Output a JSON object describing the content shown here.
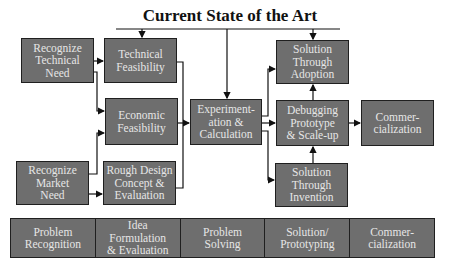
{
  "title": "Current State of the Art",
  "boxes": {
    "recognize_technical_need": "Recognize\nTechnical\nNeed",
    "technical_feasibility": "Technical\nFeasibility",
    "economic_feasibility": "Economic\nFeasibility",
    "recognize_market_need": "Recognize\nMarket\nNeed",
    "rough_design": "Rough Design\nConcept &\nEvaluation",
    "experimentation": "Experiment-\nation &\nCalculation",
    "solution_adoption": "Solution\nThrough\nAdoption",
    "debugging": "Debugging\nPrototype\n& Scale-up",
    "commercialization": "Commer-\ncialization",
    "solution_invention": "Solution\nThrough\nInvention"
  },
  "phases": [
    "Problem\nRecognition",
    "Idea\nFormulation\n& Evaluation",
    "Problem\nSolving",
    "Solution/\nPrototyping",
    "Commer-\ncialization"
  ],
  "colors": {
    "box_fill": "#6e6e6e",
    "box_border": "#1f1f1f",
    "box_text": "#e6e6e6"
  }
}
